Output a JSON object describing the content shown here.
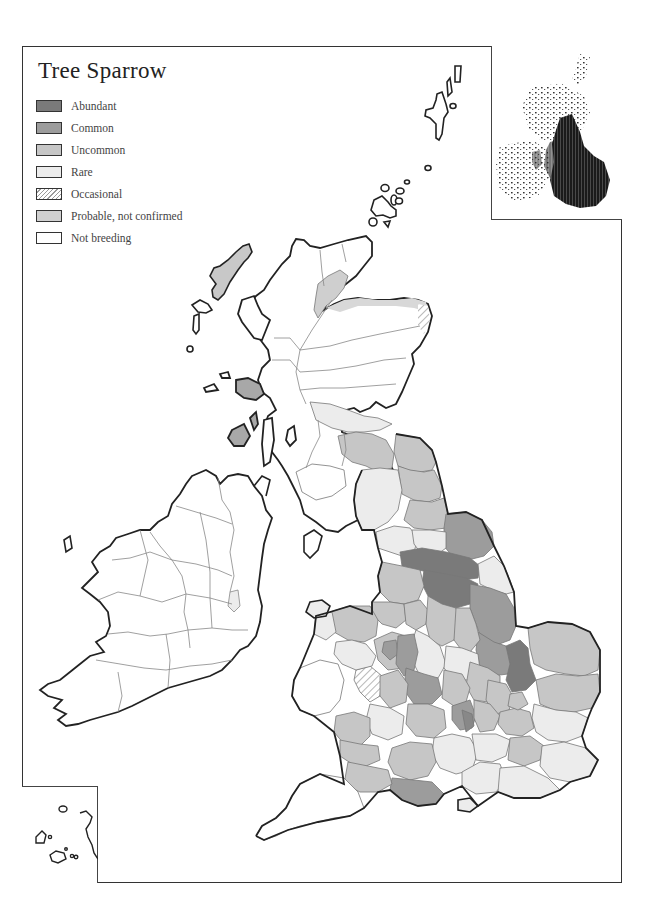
{
  "map": {
    "title": "Tree Sparrow",
    "legend": [
      {
        "label": "Abundant",
        "color": "#7a7a7a",
        "pattern": "solid"
      },
      {
        "label": "Common",
        "color": "#9c9c9c",
        "pattern": "solid"
      },
      {
        "label": "Uncommon",
        "color": "#c6c6c6",
        "pattern": "solid"
      },
      {
        "label": "Rare",
        "color": "#ececec",
        "pattern": "solid"
      },
      {
        "label": "Occasional",
        "color": "#ffffff",
        "pattern": "hatched"
      },
      {
        "label": "Probable, not confirmed",
        "color": "#d0d0d0",
        "pattern": "solid"
      },
      {
        "label": "Not breeding",
        "color": "#ffffff",
        "pattern": "solid"
      }
    ],
    "insets": {
      "top_right": "distribution-grid-map",
      "bottom_left": "scilly-isles"
    },
    "colors": {
      "outline": "#222222",
      "county_border": "#777777",
      "frame": "#333333"
    }
  }
}
